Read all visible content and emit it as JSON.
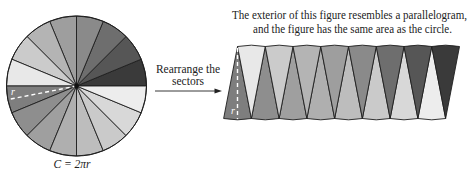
{
  "figure": {
    "caption": {
      "line1": "The exterior of this figure resembles a parallelogram,",
      "line2": "and the figure has the same area as the circle."
    },
    "arrow_label": {
      "line1": "Rearrange the",
      "line2": "sectors"
    },
    "circle": {
      "radius_label": "r",
      "circumference_label": "C = 2πr",
      "sector_count": 16,
      "sector_colors": [
        "#3a3a3a",
        "#565656",
        "#6e6e6e",
        "#8a8a8a",
        "#9e9e9e",
        "#b4b4b4",
        "#cbcbcb",
        "#e8e8e8",
        "#7e7e7e",
        "#8e8e8e",
        "#9f9f9f",
        "#afafaf",
        "#bdbdbd",
        "#cacaca",
        "#d8d8d8",
        "#ededed"
      ]
    },
    "parallelogram": {
      "radius_label": "r",
      "top_row_colors": [
        "#e8e8e8",
        "#cbcbcb",
        "#b4b4b4",
        "#9e9e9e",
        "#8a8a8a",
        "#6e6e6e",
        "#565656",
        "#3a3a3a"
      ],
      "bottom_row_colors": [
        "#7e7e7e",
        "#8e8e8e",
        "#9f9f9f",
        "#afafaf",
        "#bdbdbd",
        "#cacaca",
        "#d8d8d8",
        "#ededed"
      ]
    },
    "colors": {
      "outline": "#1e1e1e",
      "radius_line": "#ffffff",
      "text": "#222222"
    }
  }
}
